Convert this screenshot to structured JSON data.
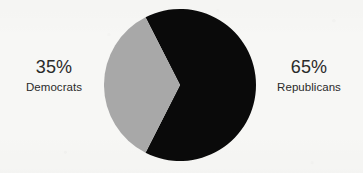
{
  "chart_data": {
    "type": "pie",
    "title": "",
    "subtitle": "",
    "xlabel": "",
    "ylabel": "",
    "legend_position": "outside-left-right",
    "grid": false,
    "categories": [
      "Democrats",
      "Republicans"
    ],
    "values": [
      35,
      65
    ],
    "value_unit": "%",
    "slices": [
      {
        "label": "Democrats",
        "value": 35,
        "value_label": "35%",
        "color": "#a8a8a8",
        "label_side": "left",
        "start_angle_deg": 117,
        "end_angle_deg": 243
      },
      {
        "label": "Republicans",
        "value": 65,
        "value_label": "65%",
        "color": "#0a0a0a",
        "label_side": "right",
        "start_angle_deg": 243,
        "end_angle_deg": 477
      }
    ]
  },
  "figure": {
    "background_color": "#f7f7f5",
    "text_color": "#2a2a2a",
    "center_x": 76,
    "center_y": 76,
    "radius": 76
  },
  "labels": {
    "democrats": {
      "percent": "35%",
      "party": "Democrats"
    },
    "republicans": {
      "percent": "65%",
      "party": "Republicans"
    }
  }
}
